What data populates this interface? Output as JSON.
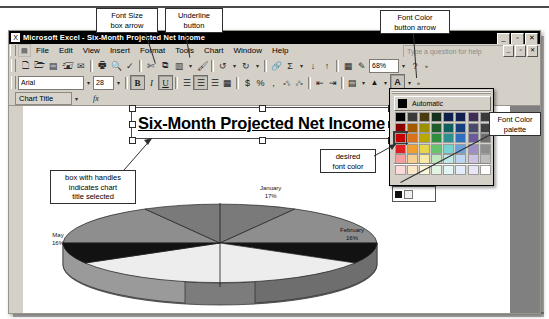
{
  "app": {
    "title": "Microsoft Excel - Six-Month Projected Net Income",
    "window_buttons": [
      "_",
      "▫",
      "✕"
    ],
    "doc_buttons": [
      "_",
      "▫",
      "✕"
    ]
  },
  "menu": {
    "items": [
      "File",
      "Edit",
      "View",
      "Insert",
      "Format",
      "Tools",
      "Chart",
      "Window",
      "Help"
    ],
    "ask_placeholder": "Type a question for help"
  },
  "standard_toolbar": {
    "buttons": [
      {
        "name": "new-icon",
        "glyph": "🗋"
      },
      {
        "name": "open-icon",
        "glyph": "🗁"
      },
      {
        "name": "save-icon",
        "glyph": "💾"
      },
      {
        "name": "permission-icon",
        "glyph": "🖨"
      },
      {
        "name": "email-icon",
        "glyph": "✉"
      },
      {
        "name": "print-icon",
        "glyph": "🖶"
      },
      {
        "name": "print-preview-icon",
        "glyph": "🔍"
      },
      {
        "name": "spelling-icon",
        "glyph": "✓"
      },
      {
        "name": "cut-icon",
        "glyph": "✂"
      },
      {
        "name": "copy-icon",
        "glyph": "⧉"
      },
      {
        "name": "paste-icon",
        "glyph": "📋"
      },
      {
        "name": "format-painter-icon",
        "glyph": "🖌"
      },
      {
        "name": "undo-icon",
        "glyph": "↶"
      },
      {
        "name": "redo-icon",
        "glyph": "↷"
      },
      {
        "name": "hyperlink-icon",
        "glyph": "🔗"
      },
      {
        "name": "autosum-icon",
        "glyph": "Σ"
      },
      {
        "name": "sort-ascending-icon",
        "glyph": "A↓"
      },
      {
        "name": "sort-descending-icon",
        "glyph": "Z↓"
      },
      {
        "name": "chart-wizard-icon",
        "glyph": "📊"
      },
      {
        "name": "drawing-icon",
        "glyph": "✏"
      }
    ],
    "zoom_value": "68%",
    "help_glyph": "?"
  },
  "formatting_toolbar": {
    "font_name": "Arial",
    "font_size": "28",
    "bold_label": "B",
    "italic_label": "I",
    "underline_label": "U",
    "align_left_label": "≡",
    "align_center_label": "≡",
    "align_right_label": "≡",
    "merge_label": "⊞",
    "currency_label": "$",
    "percent_label": "%",
    "comma_label": ",",
    "increase_decimal_label": ".00",
    "decrease_decimal_label": ".0",
    "decrease_indent_label": "⇤",
    "increase_indent_label": "⇥",
    "borders_label": "⊞",
    "fill_color_label": "▲",
    "font_color_label": "A"
  },
  "name_box": {
    "value": "Chart Title",
    "fx_label": "fx"
  },
  "chart": {
    "title": "Six-Month Projected Net Income"
  },
  "palette": {
    "automatic_label": "Automatic",
    "tooltip": "Red",
    "row1": [
      "#000000",
      "#3a3a3a",
      "#4a3b10",
      "#15301f",
      "#0d1f4a",
      "#10204f",
      "#3f2d55",
      "#3a3a3a"
    ],
    "row2": [
      "#8a0000",
      "#a35b00",
      "#9c8f00",
      "#1f5c2b",
      "#105f5f",
      "#14407f",
      "#4a4a6e",
      "#404040"
    ],
    "row3": [
      "#c60000",
      "#d9721a",
      "#b9a800",
      "#2f8f3f",
      "#2e8f8f",
      "#2f6fc0",
      "#6a5a9c",
      "#6e6e6e"
    ],
    "row4": [
      "#e02020",
      "#f0a030",
      "#e8d64a",
      "#66c46e",
      "#76d2d2",
      "#6da2de",
      "#9b8fc6",
      "#8e8e8e"
    ],
    "row5": [
      "#f5a0a0",
      "#f7cf8f",
      "#f6eba8",
      "#bfe6bf",
      "#bfe9e9",
      "#bcd6f2",
      "#ccc3e4",
      "#bdbdbd"
    ],
    "row6": [
      "#fbdada",
      "#fbe8c9",
      "#fcf7d9",
      "#e2f4e2",
      "#e2f6f6",
      "#e1edfb",
      "#eae5f4",
      "#ffffff"
    ],
    "row7": [
      "#666666",
      "#000000",
      "#ffffff",
      "#f2f2f2",
      "#2b2b2b",
      "#7f7f7f",
      "#b0b0b0",
      "#d9d9d9"
    ]
  },
  "legend": {
    "swatches": [
      "#111111",
      "#f0f0f0"
    ]
  },
  "callouts": [
    {
      "name": "callout-font-size-box-arrow",
      "text": "Font Size\nbox arrow"
    },
    {
      "name": "callout-underline-button",
      "text": "Underline\nbutton"
    },
    {
      "name": "callout-font-color-button-arrow",
      "text": "Font Color\nbutton arrow"
    },
    {
      "name": "callout-font-color-palette",
      "text": "Font Color\npalette"
    },
    {
      "name": "callout-desired-font-color",
      "text": "desired\nfont color"
    },
    {
      "name": "callout-chart-title-selected",
      "text": "box with handles\nindicates chart\ntitle selected"
    }
  ],
  "chart_data": {
    "type": "pie",
    "title": "Six-Month Projected Net Income",
    "categories": [
      "January",
      "February",
      "March",
      "April",
      "May",
      "June"
    ],
    "values": [
      17,
      16,
      16,
      15,
      16,
      20
    ],
    "labels": [
      {
        "name": "June",
        "percent": "20%"
      },
      {
        "name": "January",
        "percent": "17%"
      },
      {
        "name": "February",
        "percent": "16%"
      },
      {
        "name": "May",
        "percent": "16%"
      }
    ],
    "legend_position": "right",
    "three_d": true
  }
}
